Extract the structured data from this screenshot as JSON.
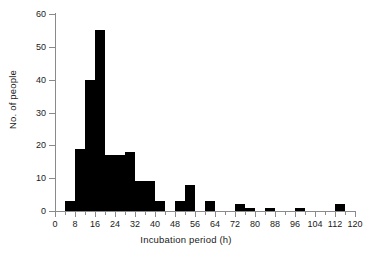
{
  "chart_data": {
    "type": "bar",
    "title": "",
    "subtitle": "",
    "xlabel": "Incubation period  (h)",
    "ylabel": "No. of people",
    "xlim": [
      0,
      120
    ],
    "ylim": [
      0,
      60
    ],
    "bin_width": 4,
    "grid": false,
    "legend": null,
    "bar_color": "#000000",
    "axis_color": "#8a8a8a",
    "x_tick_labels": [
      "0",
      "8",
      "16",
      "24",
      "32",
      "40",
      "48",
      "56",
      "64",
      "72",
      "80",
      "88",
      "96",
      "104",
      "112",
      "120"
    ],
    "x_tick_values": [
      0,
      8,
      16,
      24,
      32,
      40,
      48,
      56,
      64,
      72,
      80,
      88,
      96,
      104,
      112,
      120
    ],
    "x_minor_tick_values": [
      4,
      12,
      20,
      28,
      36,
      44,
      52,
      60,
      68,
      76,
      84,
      92,
      100,
      108,
      116
    ],
    "y_tick_labels": [
      "0",
      "10",
      "20",
      "30",
      "40",
      "50",
      "60"
    ],
    "y_tick_values": [
      0,
      10,
      20,
      30,
      40,
      50,
      60
    ],
    "categories": [
      "4-8",
      "8-12",
      "12-16",
      "16-20",
      "20-24",
      "24-28",
      "28-32",
      "32-36",
      "36-40",
      "40-44",
      "44-48",
      "48-52",
      "52-56",
      "56-60",
      "60-64",
      "64-68",
      "68-72",
      "72-76",
      "76-80",
      "80-84",
      "84-88",
      "88-92",
      "92-96",
      "96-100",
      "100-104",
      "104-108",
      "108-112",
      "112-116"
    ],
    "bins": [
      {
        "x0": 4,
        "x1": 8,
        "value": 3
      },
      {
        "x0": 8,
        "x1": 12,
        "value": 19
      },
      {
        "x0": 12,
        "x1": 16,
        "value": 40
      },
      {
        "x0": 16,
        "x1": 20,
        "value": 55
      },
      {
        "x0": 20,
        "x1": 24,
        "value": 17
      },
      {
        "x0": 24,
        "x1": 28,
        "value": 17
      },
      {
        "x0": 28,
        "x1": 32,
        "value": 18
      },
      {
        "x0": 32,
        "x1": 36,
        "value": 9
      },
      {
        "x0": 36,
        "x1": 40,
        "value": 9
      },
      {
        "x0": 40,
        "x1": 44,
        "value": 3
      },
      {
        "x0": 44,
        "x1": 48,
        "value": 0
      },
      {
        "x0": 48,
        "x1": 52,
        "value": 3
      },
      {
        "x0": 52,
        "x1": 56,
        "value": 8
      },
      {
        "x0": 56,
        "x1": 60,
        "value": 0
      },
      {
        "x0": 60,
        "x1": 64,
        "value": 3
      },
      {
        "x0": 64,
        "x1": 68,
        "value": 0
      },
      {
        "x0": 68,
        "x1": 72,
        "value": 0
      },
      {
        "x0": 72,
        "x1": 76,
        "value": 2
      },
      {
        "x0": 76,
        "x1": 80,
        "value": 1
      },
      {
        "x0": 80,
        "x1": 84,
        "value": 0
      },
      {
        "x0": 84,
        "x1": 88,
        "value": 1
      },
      {
        "x0": 88,
        "x1": 92,
        "value": 0
      },
      {
        "x0": 92,
        "x1": 96,
        "value": 0
      },
      {
        "x0": 96,
        "x1": 100,
        "value": 1
      },
      {
        "x0": 100,
        "x1": 104,
        "value": 0
      },
      {
        "x0": 104,
        "x1": 108,
        "value": 0
      },
      {
        "x0": 108,
        "x1": 112,
        "value": 0
      },
      {
        "x0": 112,
        "x1": 116,
        "value": 2
      }
    ],
    "values": [
      3,
      19,
      40,
      55,
      17,
      17,
      18,
      9,
      9,
      3,
      0,
      3,
      8,
      0,
      3,
      0,
      0,
      2,
      1,
      0,
      1,
      0,
      0,
      1,
      0,
      0,
      0,
      2
    ]
  }
}
